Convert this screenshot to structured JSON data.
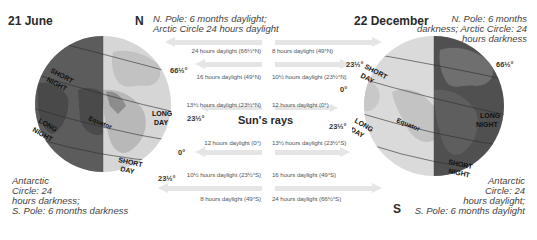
{
  "left_panel": {
    "date": "21 June",
    "north_label": "N",
    "north_note_line1": "N. Pole: 6 months daylight;",
    "north_note_line2": "Arctic Circle 24 hours daylight",
    "south_note_line1": "Antarctic",
    "south_note_line2": "Circle: 24",
    "south_note_line3": "hours darkness;",
    "south_note_line4": "S. Pole: 6 months darkness",
    "globe_labels": {
      "short_night_1": "SHORT",
      "short_night_2": "NIGHT",
      "long_day_1": "LONG",
      "long_day_2": "DAY",
      "equator": "Equator",
      "long_night_1": "LONG",
      "long_night_2": "NIGHT",
      "short_day_1": "SHORT",
      "short_day_2": "DAY"
    },
    "latitudes": {
      "arctic": "66½°",
      "tropic_n": "23½°",
      "equator": "0°",
      "tropic_s": "23½°"
    },
    "daylight_hours": [
      "24 hours daylight (66½°N)",
      "16 hours daylight (49°N)",
      "13½ hours daylight (23½°N)",
      "12 hours daylight (0°)",
      "10½ hours daylight (23½°S)",
      "8 hours daylight (49°S)"
    ]
  },
  "right_panel": {
    "date": "22 December",
    "south_label": "S",
    "north_note_line1": "N. Pole: 6 months",
    "north_note_line2": "darkness; Arctic Circle: 24",
    "north_note_line3": "hours darkness",
    "south_note_line1": "Antarctic",
    "south_note_line2": "Circle: 24",
    "south_note_line3": "hours daylight;",
    "south_note_line4": "S. Pole: 6 months daylight",
    "globe_labels": {
      "short_day_1": "SHORT",
      "short_day_2": "DAY",
      "long_night_1": "LONG",
      "long_night_2": "NIGHT",
      "equator": "Equator",
      "long_day_1": "LONG",
      "long_day_2": "DAY",
      "short_night_1": "SHORT",
      "short_night_2": "NIGHT"
    },
    "latitudes": {
      "tropic_n": "23½°",
      "equator": "0°",
      "tropic_s": "23½°",
      "arctic": "66½°"
    },
    "daylight_hours": [
      "8 hours daylight (49°N)",
      "10½ hours daylight (23½°N)",
      "12 hours daylight (0°)",
      "13½ hours daylight (23½°S)",
      "16 hours daylight (49°S)",
      "24 hours daylight (66½°S)"
    ]
  },
  "center": {
    "sun_rays_label": "Sun's rays"
  },
  "colors": {
    "night": "#5a5a5a",
    "night_land": "#3f3f3f",
    "day": "#d8d8d8",
    "day_land": "#bdbdbd",
    "arrow": "#e4e4e4"
  }
}
